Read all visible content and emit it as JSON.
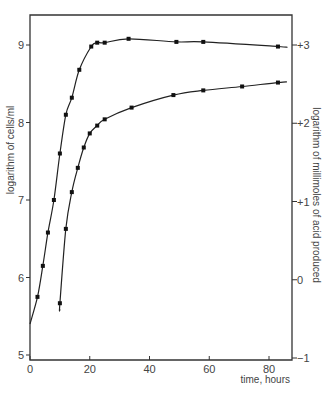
{
  "chart_data": {
    "type": "line",
    "title": "",
    "xlabel": "time, hours",
    "ylabel": "logarithm of cells/ml",
    "y2label": "logarithm of millimoles of acid produced",
    "xlim": [
      0,
      87
    ],
    "ylim": [
      5,
      9.4
    ],
    "y2lim": [
      -1,
      3.4
    ],
    "x_ticks": [
      0,
      20,
      40,
      60,
      80
    ],
    "x_tick_labels": [
      "0",
      "20",
      "40",
      "60",
      "80"
    ],
    "y_ticks": [
      5,
      6,
      7,
      8,
      9
    ],
    "y_tick_labels": [
      "5",
      "6",
      "7",
      "8",
      "9"
    ],
    "y2_ticks": [
      -1,
      0,
      1,
      2,
      3
    ],
    "y2_tick_labels": [
      "−1",
      "0",
      "+1",
      "+2",
      "+3"
    ],
    "grid": false,
    "legend": null,
    "series": [
      {
        "name": "log cells/ml",
        "axis": "left",
        "marker": "square",
        "x": [
          2.5,
          4.3,
          6,
          8,
          10,
          12,
          14,
          16.5,
          20.5,
          22.5,
          25,
          33,
          49,
          58,
          83
        ],
        "values": [
          5.75,
          6.15,
          6.58,
          7.0,
          7.6,
          8.1,
          8.32,
          8.68,
          8.98,
          9.03,
          9.03,
          9.08,
          9.04,
          9.04,
          8.98
        ],
        "curve_start": [
          0,
          5.4
        ],
        "curve_end": [
          86,
          8.97
        ]
      },
      {
        "name": "log millimoles of acid produced",
        "axis": "right",
        "marker": "square",
        "x": [
          10,
          12,
          14,
          16,
          18,
          20,
          22.5,
          25,
          34,
          48,
          58,
          71,
          83
        ],
        "values": [
          -0.3,
          0.65,
          1.12,
          1.43,
          1.69,
          1.87,
          1.97,
          2.05,
          2.2,
          2.36,
          2.42,
          2.47,
          2.52
        ],
        "curve_start": [
          10,
          -0.38
        ],
        "curve_end": [
          86,
          2.53
        ]
      }
    ]
  }
}
